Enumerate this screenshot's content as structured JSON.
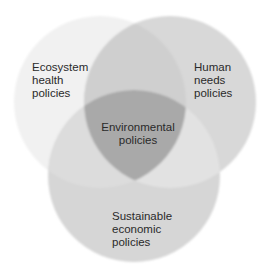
{
  "diagram": {
    "type": "venn",
    "sets": [
      {
        "id": "ecosystem",
        "label_lines": [
          "Ecosystem",
          "health",
          "policies"
        ],
        "fill": "#f1f1f1"
      },
      {
        "id": "human",
        "label_lines": [
          "Human",
          "needs",
          "policies"
        ],
        "fill": "#d8d8d8"
      },
      {
        "id": "economic",
        "label_lines": [
          "Sustainable",
          "economic",
          "policies"
        ],
        "fill": "#d6d6d6"
      }
    ],
    "center": {
      "label_lines": [
        "Environmental",
        "policies"
      ],
      "fill": "#a9a9a9"
    },
    "colors": {
      "ecosystem_human_overlap": "#cfcfcf",
      "ecosystem_economic_overlap": "#dcdcdc",
      "human_economic_overlap": "#e2e2e2"
    }
  }
}
